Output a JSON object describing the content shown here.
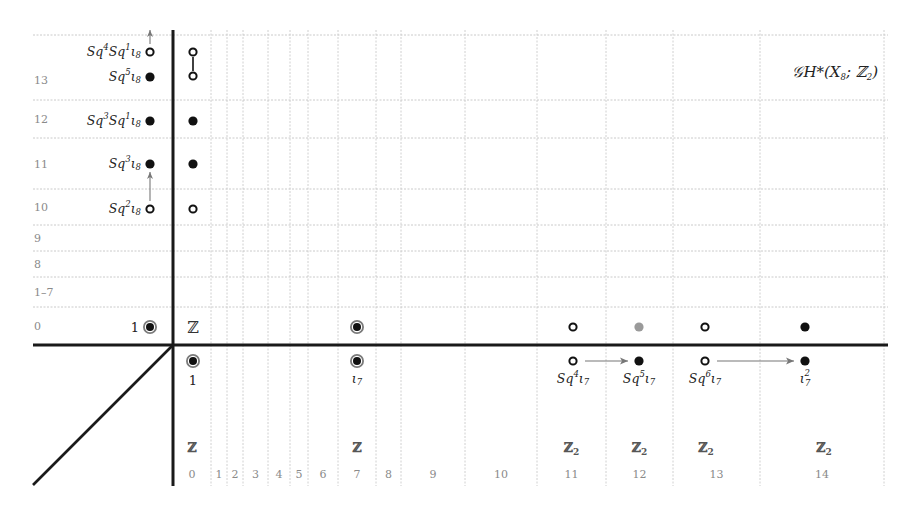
{
  "title": {
    "text": "𝒢H*(X",
    "sub": "8",
    "tail": "; ℤ",
    "tail_sub": "2",
    "close": ")"
  },
  "rows": [
    {
      "label": "13",
      "y1": 35,
      "y2": 100
    },
    {
      "label": "12",
      "y1": 100,
      "y2": 138
    },
    {
      "label": "11",
      "y1": 138,
      "y2": 189
    },
    {
      "label": "10",
      "y1": 189,
      "y2": 225
    },
    {
      "label": "9",
      "y1": 225,
      "y2": 251
    },
    {
      "label": "8",
      "y1": 251,
      "y2": 277
    },
    {
      "label": "1–7",
      "y1": 277,
      "y2": 307
    },
    {
      "label": "0",
      "y1": 307,
      "y2": 345
    }
  ],
  "columns": [
    {
      "label": "0",
      "x1": 173,
      "x2": 211,
      "group": "ℤ",
      "group_sub": ""
    },
    {
      "label": "1",
      "x1": 211,
      "x2": 227,
      "group": "",
      "group_sub": ""
    },
    {
      "label": "2",
      "x1": 227,
      "x2": 243,
      "group": "",
      "group_sub": ""
    },
    {
      "label": "3",
      "x1": 243,
      "x2": 268,
      "group": "",
      "group_sub": ""
    },
    {
      "label": "4",
      "x1": 268,
      "x2": 290,
      "group": "",
      "group_sub": ""
    },
    {
      "label": "5",
      "x1": 290,
      "x2": 308,
      "group": "",
      "group_sub": ""
    },
    {
      "label": "6",
      "x1": 308,
      "x2": 338,
      "group": "",
      "group_sub": ""
    },
    {
      "label": "7",
      "x1": 338,
      "x2": 376,
      "group": "ℤ",
      "group_sub": ""
    },
    {
      "label": "8",
      "x1": 376,
      "x2": 401,
      "group": "",
      "group_sub": ""
    },
    {
      "label": "9",
      "x1": 401,
      "x2": 465,
      "group": "",
      "group_sub": ""
    },
    {
      "label": "10",
      "x1": 465,
      "x2": 537,
      "group": "",
      "group_sub": ""
    },
    {
      "label": "11",
      "x1": 537,
      "x2": 606,
      "group": "ℤ",
      "group_sub": "2"
    },
    {
      "label": "12",
      "x1": 606,
      "x2": 673,
      "group": "ℤ",
      "group_sub": "2"
    },
    {
      "label": "13",
      "x1": 673,
      "x2": 760,
      "group": "ℤ",
      "group_sub": "2"
    },
    {
      "label": "14",
      "x1": 760,
      "x2": 884,
      "group": "ℤ",
      "group_sub": "2"
    }
  ],
  "left_column_generators": [
    {
      "base": "Sq",
      "sup1": "4",
      "mid": "Sq",
      "sup2": "1",
      "iota": "ι",
      "sub": "8",
      "x": 150,
      "y": 52,
      "dot": "open"
    },
    {
      "base": "Sq",
      "sup1": "5",
      "mid": "",
      "sup2": "",
      "iota": "ι",
      "sub": "8",
      "x": 150,
      "y": 77,
      "dot": "filled"
    },
    {
      "base": "Sq",
      "sup1": "3",
      "mid": "Sq",
      "sup2": "1",
      "iota": "ι",
      "sub": "8",
      "x": 150,
      "y": 121,
      "dot": "filled"
    },
    {
      "base": "Sq",
      "sup1": "3",
      "mid": "",
      "sup2": "",
      "iota": "ι",
      "sub": "8",
      "x": 150,
      "y": 164,
      "dot": "filled"
    },
    {
      "base": "Sq",
      "sup1": "2",
      "mid": "",
      "sup2": "",
      "iota": "ι",
      "sub": "8",
      "x": 150,
      "y": 209,
      "dot": "open"
    }
  ],
  "left_unit": {
    "label": "1",
    "x": 150,
    "y": 327
  },
  "column0_top": [
    {
      "x": 193,
      "y": 52,
      "dot": "open"
    },
    {
      "x": 193,
      "y": 76,
      "dot": "open"
    },
    {
      "x": 193,
      "y": 121,
      "dot": "filled"
    },
    {
      "x": 193,
      "y": 164,
      "dot": "filled"
    },
    {
      "x": 193,
      "y": 209,
      "dot": "open"
    }
  ],
  "row0_ring_label": "ℤ",
  "upper_row_dots": [
    {
      "x": 357,
      "y": 327,
      "dot": "ring"
    },
    {
      "x": 573,
      "y": 327,
      "dot": "open"
    },
    {
      "x": 639,
      "y": 327,
      "dot": "gray"
    },
    {
      "x": 705,
      "y": 327,
      "dot": "open"
    },
    {
      "x": 805,
      "y": 327,
      "dot": "filled"
    }
  ],
  "lower_row_generators": [
    {
      "x": 193,
      "y": 361,
      "dot": "ring",
      "label": "1",
      "label_kind": "num"
    },
    {
      "x": 357,
      "y": 361,
      "dot": "ring",
      "label": "ι",
      "sub": "7",
      "sup": "",
      "pre": "",
      "pre_sup": ""
    },
    {
      "x": 573,
      "y": 361,
      "dot": "open",
      "pre": "Sq",
      "pre_sup": "4",
      "label": "ι",
      "sub": "7",
      "sup": ""
    },
    {
      "x": 639,
      "y": 361,
      "dot": "filled",
      "pre": "Sq",
      "pre_sup": "5",
      "label": "ι",
      "sub": "7",
      "sup": ""
    },
    {
      "x": 705,
      "y": 361,
      "dot": "open",
      "pre": "Sq",
      "pre_sup": "6",
      "label": "ι",
      "sub": "7",
      "sup": ""
    },
    {
      "x": 805,
      "y": 361,
      "dot": "filled",
      "pre": "",
      "pre_sup": "",
      "label": "ι",
      "sub": "7",
      "sup": "2"
    }
  ],
  "arrows": [
    {
      "from": [
        150,
        44
      ],
      "to": [
        150,
        30
      ],
      "kind": "vertical"
    },
    {
      "from": [
        150,
        201
      ],
      "to": [
        150,
        172
      ],
      "kind": "vertical"
    },
    {
      "from": [
        585,
        361
      ],
      "to": [
        628,
        361
      ],
      "kind": "horizontal"
    },
    {
      "from": [
        717,
        361
      ],
      "to": [
        794,
        361
      ],
      "kind": "horizontal"
    }
  ],
  "connectors": [
    {
      "from": [
        193,
        57
      ],
      "to": [
        193,
        71
      ]
    }
  ],
  "colors": {
    "axis": "#1a1a1a",
    "grid": "#c0c0c0",
    "label_gray": "#8a8a8a",
    "arrow": "#777777",
    "dot": "#111111"
  }
}
